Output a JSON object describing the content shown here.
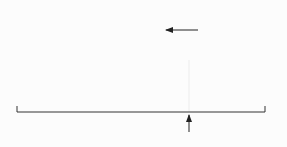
{
  "chart_data": {
    "type": "area",
    "title": "",
    "xlabel": "",
    "ylabel": "",
    "x_ticks": [
      -3,
      -2,
      -1,
      0,
      1,
      2,
      3
    ],
    "xlim": [
      -4,
      4
    ],
    "shaded_region": {
      "from": -4,
      "to": 1.55
    },
    "annotations": [
      {
        "text": "Area represents\nPercent below\nz-score",
        "lines": [
          "Area represents",
          "Percent below",
          "z-score"
        ]
      },
      {
        "text": "z-score",
        "pointer_x": 1.55
      }
    ],
    "grid": false,
    "colors": {
      "fill": "#bcbcbc",
      "line": "#555555",
      "background": "#fcfcfc"
    }
  },
  "labels": {
    "tick_m3": "−3",
    "tick_m2": "−2",
    "tick_m1": "−1",
    "tick_0": "0",
    "tick_1": "1",
    "tick_2": "2",
    "tick_3": "3",
    "area_line1": "Area represents",
    "area_line2": "Percent below",
    "area_line3": "z-score",
    "zscore_label": "z-score"
  }
}
